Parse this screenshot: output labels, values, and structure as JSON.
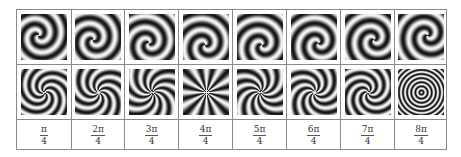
{
  "figure": {
    "rows": [
      {
        "name": "top-row",
        "patterns": [
          {
            "type": "fan",
            "k": 1
          },
          {
            "type": "fan",
            "k": 2
          },
          {
            "type": "fan",
            "k": 3
          },
          {
            "type": "fan",
            "k": 4
          },
          {
            "type": "fan",
            "k": 5
          },
          {
            "type": "fan",
            "k": 6
          },
          {
            "type": "fan",
            "k": 7
          },
          {
            "type": "fan",
            "k": 8
          }
        ]
      },
      {
        "name": "bottom-row",
        "patterns": [
          {
            "type": "spiral",
            "k": 1
          },
          {
            "type": "spiral",
            "k": 2
          },
          {
            "type": "spiral",
            "k": 3
          },
          {
            "type": "spiral",
            "k": 4
          },
          {
            "type": "spiral",
            "k": 5
          },
          {
            "type": "spiral",
            "k": 6
          },
          {
            "type": "spiral",
            "k": 7
          },
          {
            "type": "spiral",
            "k": 8
          }
        ]
      }
    ],
    "labels": [
      {
        "num": "π",
        "den": "4"
      },
      {
        "num": "2π",
        "den": "4"
      },
      {
        "num": "3π",
        "den": "4"
      },
      {
        "num": "4π",
        "den": "4"
      },
      {
        "num": "5π",
        "den": "4"
      },
      {
        "num": "6π",
        "den": "4"
      },
      {
        "num": "7π",
        "den": "4"
      },
      {
        "num": "8π",
        "den": "4"
      }
    ],
    "colors": {
      "border": "#8a8a8a",
      "dark": "#111111",
      "light": "#f4f4f4"
    }
  }
}
